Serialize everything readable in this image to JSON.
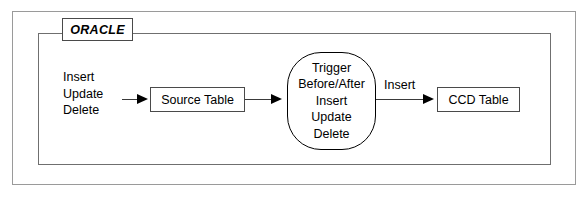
{
  "diagram": {
    "container_label": "ORACLE",
    "colors": {
      "background": "#ffffff",
      "outer_frame_border": "#9a9a9a",
      "boundary_border": "#6f6f6f",
      "node_border": "#4a4a4a",
      "oval_border": "#000000",
      "connector": "#3a3a3a",
      "text": "#000000"
    },
    "input_operations": [
      "Insert",
      "Update",
      "Delete"
    ],
    "nodes": {
      "source_table": "Source Table",
      "trigger": [
        "Trigger",
        "Before/After",
        "Insert",
        "Update",
        "Delete"
      ],
      "ccd_table": "CCD Table"
    },
    "edges": [
      {
        "from": "input_operations",
        "to": "source_table",
        "label": ""
      },
      {
        "from": "source_table",
        "to": "trigger",
        "label": ""
      },
      {
        "from": "trigger",
        "to": "ccd_table",
        "label": "Insert"
      }
    ],
    "edge_labels": {
      "trigger_to_ccd": "Insert"
    }
  }
}
